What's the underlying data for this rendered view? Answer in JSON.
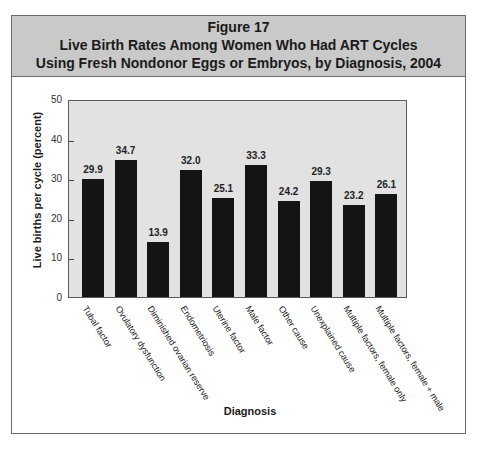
{
  "figure": {
    "number_label": "Figure 17",
    "title_line1": "Live Birth Rates Among Women Who Had ART Cycles",
    "title_line2": "Using Fresh Nondonor Eggs or Embryos, by Diagnosis, 2004"
  },
  "colors": {
    "header_bg": "#c9c9c9",
    "plot_bg": "#e2e2e2",
    "bar": "#141414"
  },
  "chart_data": {
    "type": "bar",
    "title": "Live Birth Rates Among Women Who Had ART Cycles Using Fresh Nondonor Eggs or Embryos, by Diagnosis, 2004",
    "xlabel": "Diagnosis",
    "ylabel": "Live births per cycle (percent)",
    "ylim": [
      0,
      50
    ],
    "yticks": [
      0,
      10,
      20,
      30,
      40,
      50
    ],
    "grid": false,
    "legend": null,
    "categories": [
      "Tubal factor",
      "Ovulatory dysfunction",
      "Diminished ovarian reserve",
      "Endometriosis",
      "Uterine factor",
      "Male factor",
      "Other cause",
      "Unexplained cause",
      "Multiple factors, female only",
      "Multiple factors, female + male"
    ],
    "values": [
      29.9,
      34.7,
      13.9,
      32.0,
      25.1,
      33.3,
      24.2,
      29.3,
      23.2,
      26.1
    ],
    "value_labels": [
      "29.9",
      "34.7",
      "13.9",
      "32.0",
      "25.1",
      "33.3",
      "24.2",
      "29.3",
      "23.2",
      "26.1"
    ]
  }
}
